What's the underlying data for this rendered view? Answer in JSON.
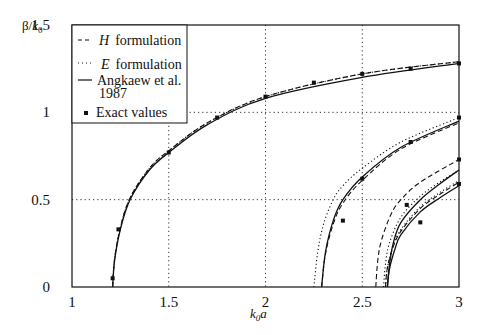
{
  "chart_data": {
    "type": "line",
    "title": "",
    "xlabel": "k0a",
    "ylabel": "β/k0",
    "xlim": [
      1,
      3
    ],
    "ylim": [
      0,
      1.5
    ],
    "xticks": [
      "1",
      "1.5",
      "2",
      "2.5",
      "3"
    ],
    "yticks": [
      "0",
      "0.5",
      "1",
      "1.5"
    ],
    "grid": "dotted at x=1.5,2,2.5 and y=0.5,1",
    "legend_position": "upper-left",
    "legend": [
      {
        "label_italic": "H",
        "label": "formulation",
        "style": "dashed"
      },
      {
        "label_italic": "E",
        "label": "formulation",
        "style": "dotted"
      },
      {
        "label": "Angkaew et al. 1987",
        "style": "solid"
      },
      {
        "label": "Exact values",
        "style": "square-marker"
      }
    ],
    "series": [
      {
        "name": "Mode 1 - Angkaew et al 1987",
        "style": "solid",
        "x": [
          1.21,
          1.22,
          1.25,
          1.3,
          1.4,
          1.5,
          1.7,
          2.0,
          2.5,
          3.0
        ],
        "y": [
          0.0,
          0.15,
          0.33,
          0.5,
          0.67,
          0.77,
          0.93,
          1.08,
          1.2,
          1.28
        ]
      },
      {
        "name": "Mode 1 - H formulation",
        "style": "dashed",
        "x": [
          1.21,
          1.22,
          1.25,
          1.3,
          1.4,
          1.5,
          1.7,
          2.0,
          2.5,
          3.0
        ],
        "y": [
          0.0,
          0.16,
          0.34,
          0.51,
          0.68,
          0.78,
          0.94,
          1.09,
          1.22,
          1.29
        ]
      },
      {
        "name": "Mode 1 - E formulation",
        "style": "dotted",
        "x": [
          1.21,
          1.22,
          1.25,
          1.3,
          1.4,
          1.5,
          1.7,
          2.0,
          2.5,
          3.0
        ],
        "y": [
          0.0,
          0.16,
          0.34,
          0.51,
          0.68,
          0.78,
          0.94,
          1.09,
          1.22,
          1.29
        ]
      },
      {
        "name": "Mode 2 - Angkaew et al 1987",
        "style": "solid",
        "x": [
          2.29,
          2.31,
          2.35,
          2.4,
          2.5,
          2.7,
          3.0
        ],
        "y": [
          0.0,
          0.2,
          0.38,
          0.5,
          0.63,
          0.8,
          0.95
        ]
      },
      {
        "name": "Mode 2 - E formulation",
        "style": "dotted",
        "x": [
          2.25,
          2.27,
          2.3,
          2.35,
          2.4,
          2.5,
          2.7,
          3.0
        ],
        "y": [
          0.0,
          0.2,
          0.36,
          0.5,
          0.58,
          0.68,
          0.83,
          0.97
        ]
      },
      {
        "name": "Mode 2 - H formulation",
        "style": "dashed",
        "x": [
          2.29,
          2.31,
          2.35,
          2.4,
          2.5,
          2.7,
          3.0
        ],
        "y": [
          0.0,
          0.19,
          0.36,
          0.48,
          0.61,
          0.79,
          0.94
        ]
      },
      {
        "name": "Mode 3 - H formulation",
        "style": "dashed",
        "x": [
          2.57,
          2.58,
          2.6,
          2.65,
          2.7,
          2.8,
          3.0
        ],
        "y": [
          0.0,
          0.15,
          0.27,
          0.42,
          0.5,
          0.6,
          0.73
        ]
      },
      {
        "name": "Mode 3 - Angkaew et al 1987",
        "style": "solid",
        "x": [
          2.63,
          2.64,
          2.66,
          2.7,
          2.8,
          2.9,
          3.0
        ],
        "y": [
          0.0,
          0.12,
          0.25,
          0.37,
          0.5,
          0.59,
          0.67
        ]
      },
      {
        "name": "Mode 3 - E formulation",
        "style": "dotted",
        "x": [
          2.61,
          2.62,
          2.64,
          2.7,
          2.8,
          2.9,
          3.0
        ],
        "y": [
          0.0,
          0.13,
          0.25,
          0.4,
          0.52,
          0.6,
          0.67
        ]
      },
      {
        "name": "Mode 4 - Angkaew et al 1987",
        "style": "solid",
        "x": [
          2.63,
          2.64,
          2.67,
          2.7,
          2.8,
          2.9,
          3.0
        ],
        "y": [
          0.0,
          0.1,
          0.22,
          0.3,
          0.43,
          0.51,
          0.58
        ]
      },
      {
        "name": "Mode 4 - H formulation",
        "style": "dashed",
        "x": [
          2.62,
          2.63,
          2.66,
          2.7,
          2.8,
          2.9,
          3.0
        ],
        "y": [
          0.0,
          0.11,
          0.23,
          0.32,
          0.45,
          0.53,
          0.6
        ]
      },
      {
        "name": "Mode 4 - E formulation",
        "style": "dotted",
        "x": [
          2.62,
          2.63,
          2.66,
          2.7,
          2.8,
          2.9,
          3.0
        ],
        "y": [
          0.0,
          0.11,
          0.24,
          0.33,
          0.46,
          0.54,
          0.61
        ]
      }
    ],
    "exact_values": {
      "x": [
        1.21,
        1.24,
        1.5,
        1.75,
        2.0,
        2.25,
        2.5,
        2.75,
        3.0,
        2.4,
        2.5,
        2.75,
        3.0,
        2.73,
        2.8,
        3.0,
        3.0
      ],
      "y": [
        0.05,
        0.33,
        0.77,
        0.97,
        1.09,
        1.17,
        1.22,
        1.25,
        1.28,
        0.38,
        0.62,
        0.83,
        0.97,
        0.47,
        0.37,
        0.73,
        0.59
      ]
    }
  }
}
